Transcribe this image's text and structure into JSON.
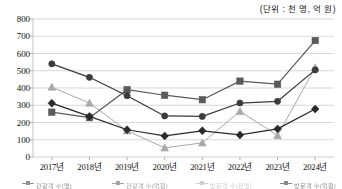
{
  "unit_note": "(단위 : 천 명, 억 원)",
  "axis": {
    "y_ticks": [
      "800",
      "700",
      "600",
      "500",
      "400",
      "300",
      "200",
      "100",
      "0"
    ],
    "x_ticks": [
      "2017년",
      "2018년",
      "2019년",
      "2020년",
      "2021년",
      "2022년",
      "2023년",
      "2024년"
    ]
  },
  "legend": {
    "items": [
      {
        "label": "관광객 수(명)",
        "color": "#3b3b3b",
        "marker": "circle"
      },
      {
        "label": "관광객 수(억원)",
        "color": "#5a5a5a",
        "marker": "square"
      },
      {
        "label": "방문객 수(천명)",
        "color": "#a8a8a8",
        "marker": "triangle"
      },
      {
        "label": "방문객 수(억원)",
        "color": "#2a2a2a",
        "marker": "diamond"
      }
    ]
  },
  "chart_data": {
    "type": "line",
    "title": "",
    "subtitle": "",
    "xlabel": "",
    "ylabel": "",
    "ylim": [
      0,
      800
    ],
    "ytick_step": 100,
    "grid": true,
    "legend_position": "bottom",
    "categories": [
      "2017년",
      "2018년",
      "2019년",
      "2020년",
      "2021년",
      "2022년",
      "2023년",
      "2024년"
    ],
    "series": [
      {
        "name": "관광객 수(명)",
        "marker": "circle",
        "color": "#3b3b3b",
        "values": [
          540,
          462,
          355,
          238,
          235,
          313,
          323,
          505
        ]
      },
      {
        "name": "관광객 수(억원)",
        "marker": "square",
        "color": "#5a5a5a",
        "values": [
          260,
          228,
          390,
          358,
          332,
          440,
          422,
          675
        ]
      },
      {
        "name": "방문객 수(천명)",
        "marker": "triangle",
        "color": "#a8a8a8",
        "values": [
          405,
          313,
          152,
          53,
          82,
          265,
          125,
          518
        ]
      },
      {
        "name": "방문객 수(억원)",
        "marker": "diamond",
        "color": "#2a2a2a",
        "values": [
          312,
          235,
          158,
          122,
          152,
          128,
          163,
          278
        ]
      }
    ]
  }
}
